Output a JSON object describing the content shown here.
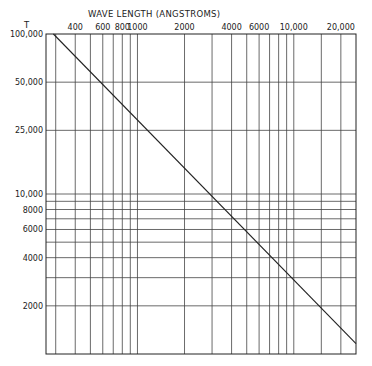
{
  "chart_data": {
    "type": "line",
    "title": "WAVE LENGTH (ANGSTROMS)",
    "xlabel": "WAVE LENGTH (ANGSTROMS)",
    "ylabel": "T",
    "xscale": "log",
    "yscale": "log",
    "xlim": [
      260,
      25000
    ],
    "ylim": [
      1000,
      100000
    ],
    "grid": true,
    "x_gridlines": [
      300,
      400,
      500,
      600,
      700,
      800,
      900,
      1000,
      2000,
      3000,
      4000,
      5000,
      6000,
      7000,
      8000,
      9000,
      10000,
      15000,
      20000
    ],
    "y_gridlines": [
      2000,
      3000,
      4000,
      5000,
      6000,
      7000,
      8000,
      9000,
      10000,
      25000,
      50000
    ],
    "x_tick_labels": [
      {
        "value": 400,
        "label": "400"
      },
      {
        "value": 600,
        "label": "600"
      },
      {
        "value": 800,
        "label": "800"
      },
      {
        "value": 1000,
        "label": "1000"
      },
      {
        "value": 2000,
        "label": "2000"
      },
      {
        "value": 4000,
        "label": "4000"
      },
      {
        "value": 6000,
        "label": "6000"
      },
      {
        "value": 10000,
        "label": "10,000"
      },
      {
        "value": 20000,
        "label": "20,000"
      }
    ],
    "y_tick_labels": [
      {
        "value": 100000,
        "label": "100,000"
      },
      {
        "value": 50000,
        "label": "50,000"
      },
      {
        "value": 25000,
        "label": "25,000"
      },
      {
        "value": 10000,
        "label": "10,000"
      },
      {
        "value": 8000,
        "label": "8000"
      },
      {
        "value": 6000,
        "label": "6000"
      },
      {
        "value": 4000,
        "label": "4000"
      },
      {
        "value": 2000,
        "label": "2000"
      }
    ],
    "series": [
      {
        "name": "Wien displacement (λ·T = constant)",
        "x": [
          290,
          25000
        ],
        "y": [
          100000,
          1160
        ]
      }
    ]
  }
}
